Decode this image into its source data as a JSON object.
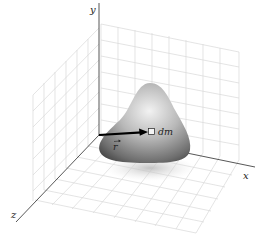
{
  "figure": {
    "axes": {
      "x_label": "x",
      "y_label": "y",
      "z_label": "z"
    },
    "vector_label": "r",
    "mass_element_label": "dm",
    "colors": {
      "axis": "#444444",
      "grid": "#d8d8d8",
      "body_light": "#e8e8e8",
      "body_dark": "#5a5a5a",
      "vector": "#000000",
      "shadow": "#cfcfcf"
    }
  }
}
